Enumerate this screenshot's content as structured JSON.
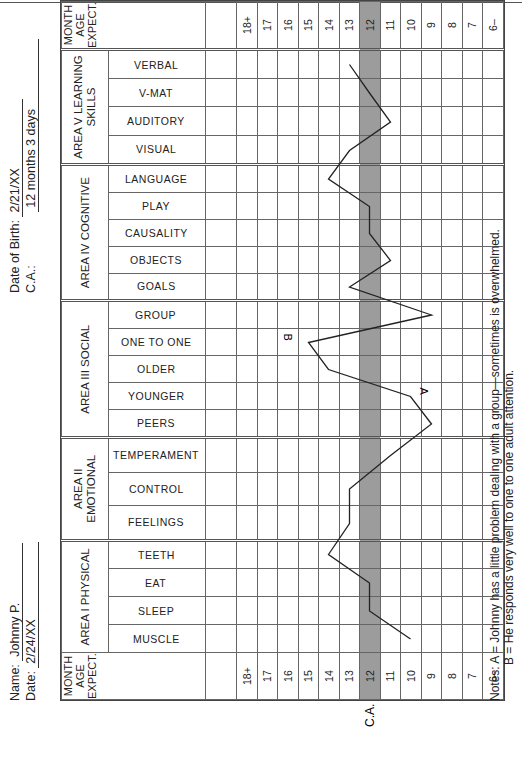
{
  "header": {
    "name_label": "Name:",
    "name_value": "Johnny P.",
    "date_label": "Date:",
    "date_value": "2/24/XX",
    "dob_label": "Date of Birth:",
    "dob_value": "2/21/XX",
    "ca_label": "C.A.:",
    "ca_value": "12 months 3 days"
  },
  "grid": {
    "month_header": "MONTH AGE EXPECT.",
    "ca_marker": "C.A.",
    "ages": [
      "18+",
      "17",
      "16",
      "15",
      "14",
      "13",
      "12",
      "11",
      "10",
      "9",
      "8",
      "7",
      "6–"
    ],
    "ca_age": "12",
    "areas": [
      {
        "title": "AREA I PHYSICAL",
        "categories": [
          "MUSCLE",
          "SLEEP",
          "EAT",
          "TEETH"
        ]
      },
      {
        "title": "AREA II EMOTIONAL",
        "categories": [
          "FEELINGS",
          "CONTROL",
          "TEMPERAMENT"
        ]
      },
      {
        "title": "AREA III SOCIAL",
        "categories": [
          "PEERS",
          "YOUNGER",
          "OLDER",
          "ONE TO ONE",
          "GROUP"
        ]
      },
      {
        "title": "AREA IV COGNITIVE",
        "categories": [
          "GOALS",
          "OBJECTS",
          "CAUSALITY",
          "PLAY",
          "LANGUAGE"
        ]
      },
      {
        "title": "AREA V LEARNING SKILLS",
        "categories": [
          "VISUAL",
          "AUDITORY",
          "V-MAT",
          "VERBAL"
        ]
      }
    ],
    "annotations": [
      {
        "label": "A",
        "category": "YOUNGER"
      },
      {
        "label": "B",
        "category": "ONE TO ONE"
      }
    ]
  },
  "notes": {
    "line1": "Notes: A = Johnny has a little problem dealing with a group—sometimes is overwhelmed.",
    "line2": "B = He responds very well to one to one adult attention."
  },
  "chart_data": {
    "type": "line",
    "xlabel": "Developmental categories (Areas I–V)",
    "ylabel": "Month Age Expect.",
    "y_ticks": [
      "6–",
      "7",
      "8",
      "9",
      "10",
      "11",
      "12",
      "13",
      "14",
      "15",
      "16",
      "17",
      "18+"
    ],
    "chronological_age_months": 12,
    "categories": [
      "MUSCLE",
      "SLEEP",
      "EAT",
      "TEETH",
      "FEELINGS",
      "CONTROL",
      "TEMPERAMENT",
      "PEERS",
      "YOUNGER",
      "OLDER",
      "ONE TO ONE",
      "GROUP",
      "GOALS",
      "OBJECTS",
      "CAUSALITY",
      "PLAY",
      "LANGUAGE",
      "VISUAL",
      "AUDITORY",
      "V-MAT",
      "VERBAL"
    ],
    "series": [
      {
        "name": "Johnny P.",
        "values": [
          10,
          12,
          12,
          14,
          13,
          13,
          11,
          9,
          10,
          14,
          15,
          9,
          13,
          11,
          12,
          12,
          14,
          13,
          11,
          12,
          13
        ]
      }
    ],
    "annotations": [
      {
        "text": "A",
        "at": "YOUNGER",
        "note": "Johnny has a little problem dealing with a group—sometimes is overwhelmed."
      },
      {
        "text": "B",
        "at": "ONE TO ONE",
        "note": "He responds very well to one to one adult attention."
      }
    ],
    "grid": true,
    "highlight_row": "12 (C.A.)"
  }
}
